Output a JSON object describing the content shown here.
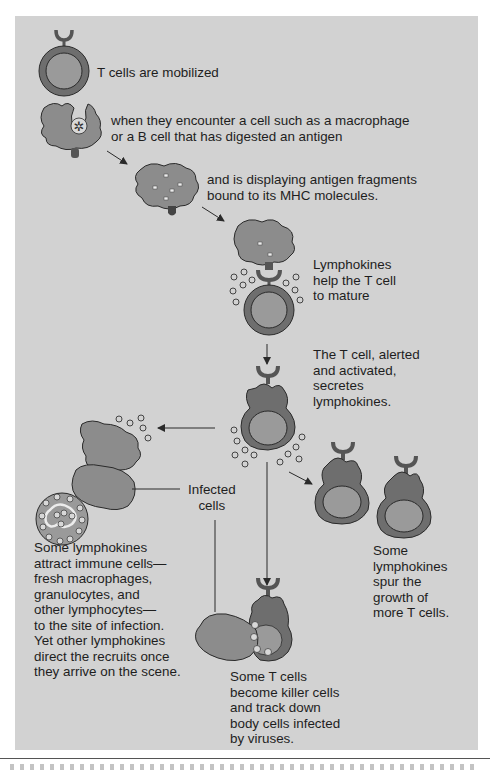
{
  "diagram": {
    "colors": {
      "panel_bg": "#d2d2d2",
      "cell_dark": "#6e6e6e",
      "cell_mid": "#8c8c8c",
      "cell_light": "#9a9a9a",
      "outline": "#2a2a2a",
      "text": "#1e1e1e"
    },
    "labels": {
      "t_cells_mobilized": "T cells are mobilized",
      "encounter": "when they encounter a cell such as a macrophage\nor a B cell that has digested an antigen",
      "displaying": "and is displaying antigen fragments\nbound to its MHC molecules.",
      "help_mature": "Lymphokines\nhelp the T cell\nto mature",
      "alerted": "The T cell, alerted\nand activated,\nsecretes\nlymphokines.",
      "infected_cells": "Infected\ncells",
      "attract": "Some lymphokines\nattract immune cells—\nfresh macrophages,\ngranulocytes, and\nother lymphocytes—\nto the site of infection.\nYet other lymphokines\ndirect the recruits once\nthey arrive on the scene.",
      "spur_growth": "Some\nlymphokines\nspur the\ngrowth of\nmore T cells.",
      "killer_cells": "Some T cells\nbecome killer cells\nand track down\nbody cells infected\nby viruses."
    },
    "nodes": [
      {
        "id": "resting-t-cell",
        "type": "T cell"
      },
      {
        "id": "macrophage-digesting",
        "type": "antigen-presenting cell"
      },
      {
        "id": "macrophage-displaying",
        "type": "antigen-presenting cell"
      },
      {
        "id": "t-cell-binding",
        "type": "T cell + APC"
      },
      {
        "id": "activated-t-cell",
        "type": "activated T cell"
      },
      {
        "id": "recruited-immune-cells",
        "type": "macrophage, granulocyte, lymphocyte"
      },
      {
        "id": "new-t-cells",
        "type": "T cells",
        "count": 2
      },
      {
        "id": "killer-t-cell",
        "type": "killer T cell + infected cell"
      }
    ]
  }
}
